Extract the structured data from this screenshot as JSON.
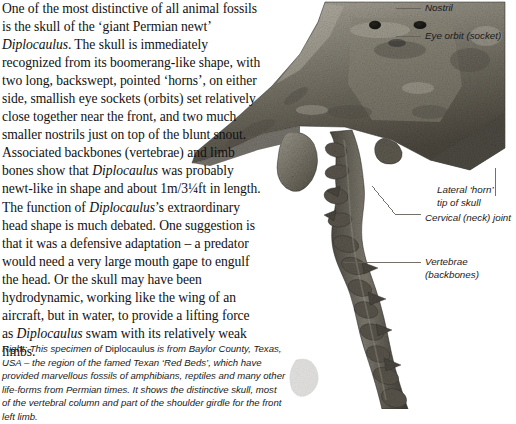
{
  "document": {
    "type": "book-page-spread",
    "subject": "Diplocaulus fossil skull"
  },
  "body_text": {
    "paragraphs": [
      {
        "id": "main",
        "runs": [
          {
            "text": "One of the most distinctive of all animal fossils is the skull of the ‘giant Permian newt’ ",
            "style": "roman"
          },
          {
            "text": "Diplocaulus",
            "style": "italic"
          },
          {
            "text": ". The skull is immediately recognized from its boomerang-like shape, with two long, backswept, pointed ‘horns’, on either side, smallish eye sockets (orbits) set relatively close together near the front, and two much smaller nostrils just on top of the blunt snout. Associated backbones (vertebrae) and limb bones show that ",
            "style": "roman"
          },
          {
            "text": "Diplocaulus",
            "style": "italic"
          },
          {
            "text": " was probably newt-like in shape and about 1m/3¼ft in length. The function of ",
            "style": "roman"
          },
          {
            "text": "Diplocaulus",
            "style": "italic"
          },
          {
            "text": "’s extraordinary head shape is much debated. One suggestion is that it was a defensive adaptation – a predator would need a very large mouth gape to engulf the head. Or the skull may have been hydrodynamic, working like the wing of an aircraft, but in water, to provide a lifting force as ",
            "style": "roman"
          },
          {
            "text": "Diplocaulus",
            "style": "italic"
          },
          {
            "text": " swam with its relatively weak limbs.",
            "style": "roman"
          }
        ]
      }
    ]
  },
  "caption": {
    "runs": [
      {
        "text": "Right: This specimen of ",
        "style": "italic"
      },
      {
        "text": "Diplocaulus",
        "style": "roman"
      },
      {
        "text": " is from Baylor County, Texas, USA – the region of the famed Texan ‘Red Beds’, which have provided marvellous fossils of amphibians, reptiles and many other life-forms from Permian times. It shows the distinctive skull, most of the vertebral column and part of the shoulder girdle for the front left limb.",
        "style": "italic"
      }
    ]
  },
  "annotations": [
    {
      "id": "nostril",
      "label": "Nostril",
      "lines": [
        "Nostril"
      ]
    },
    {
      "id": "eye-orbit",
      "label": "Eye orbit (socket)",
      "lines": [
        "Eye orbit (socket)"
      ]
    },
    {
      "id": "lateral-horn",
      "label": "Lateral ‘horn’ tip of skull",
      "lines": [
        "Lateral ‘horn’",
        "tip of skull"
      ]
    },
    {
      "id": "cervical",
      "label": "Cervical (neck) joint",
      "lines": [
        "Cervical (neck) joint"
      ]
    },
    {
      "id": "vertebrae",
      "label": "Vertebrae (backbones)",
      "lines": [
        "Vertebrae",
        "(backbones)"
      ]
    }
  ],
  "colors": {
    "page_background": "#ffffff",
    "text": "#111111",
    "leader_line": "#5a5a5a",
    "fossil_dark": "#3b3a35",
    "fossil_mid": "#6d6a60",
    "fossil_light": "#a8a49a"
  }
}
